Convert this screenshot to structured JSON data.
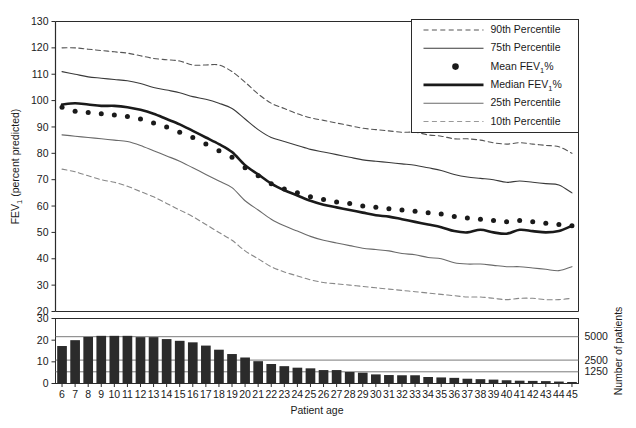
{
  "chart_data": {
    "type": "line",
    "title": "",
    "xlabel": "Patient age",
    "ylabel": "FEV1 (percent predicted)",
    "ylabel_main": "FEV",
    "ylabel_sub": "1",
    "ylabel_rest": " (percent predicted)",
    "y2label": "Number of patients",
    "xlim": [
      6,
      45
    ],
    "ylim": [
      20,
      130
    ],
    "ylim_bars": [
      0,
      30
    ],
    "grid": false,
    "legend_position": "top-right",
    "x": [
      6,
      7,
      8,
      9,
      10,
      11,
      12,
      13,
      14,
      15,
      16,
      17,
      18,
      19,
      20,
      21,
      22,
      23,
      24,
      25,
      26,
      27,
      28,
      29,
      30,
      31,
      32,
      33,
      34,
      35,
      36,
      37,
      38,
      39,
      40,
      41,
      42,
      43,
      44,
      45
    ],
    "x_tick_labels": [
      "6",
      "7",
      "8",
      "9",
      "10",
      "11",
      "12",
      "13",
      "14",
      "15",
      "16",
      "17",
      "18",
      "19",
      "20",
      "21",
      "22",
      "23",
      "24",
      "25",
      "26",
      "27",
      "28",
      "29",
      "30",
      "31",
      "32",
      "33",
      "34",
      "35",
      "36",
      "37",
      "38",
      "39",
      "40",
      "41",
      "42",
      "43",
      "44",
      "45"
    ],
    "y_tick_labels": [
      "20",
      "30",
      "40",
      "50",
      "60",
      "70",
      "80",
      "90",
      "100",
      "110",
      "120",
      "130"
    ],
    "y_ticks": [
      20,
      30,
      40,
      50,
      60,
      70,
      80,
      90,
      100,
      110,
      120,
      130
    ],
    "y_bar_tick_labels": [
      "0",
      "10",
      "20",
      "30"
    ],
    "y_bar_ticks": [
      0,
      10,
      20,
      30
    ],
    "y2_tick_labels": [
      "1250",
      "2500",
      "5000"
    ],
    "y2_ticks": [
      1250,
      2500,
      5000
    ],
    "y2_max": 6818,
    "series": [
      {
        "name": "90th Percentile",
        "style": "dashed",
        "color": "#555555",
        "width": 1.1,
        "values": [
          120,
          120,
          119.5,
          119,
          118.5,
          118,
          117,
          116,
          115.5,
          115,
          113.5,
          113.5,
          113.5,
          111,
          107,
          102.5,
          99,
          97,
          95,
          93.5,
          92.5,
          91.5,
          90.5,
          89.5,
          89,
          88.5,
          88,
          88,
          87,
          86.5,
          85.5,
          85.5,
          85,
          84,
          83.5,
          84,
          83.5,
          83,
          82.5,
          80
        ]
      },
      {
        "name": "75th Percentile",
        "style": "solid-thin",
        "color": "#3a3a3a",
        "width": 1.1,
        "values": [
          111,
          110,
          109,
          108.5,
          108,
          107.5,
          106.5,
          105,
          104,
          103,
          101.5,
          100.5,
          99,
          97,
          93,
          89,
          86,
          84.5,
          83,
          81.5,
          80.5,
          79.5,
          78.5,
          77.5,
          77,
          76.5,
          76,
          75.5,
          74.5,
          73.5,
          72,
          71,
          70.5,
          70,
          69,
          69.5,
          69,
          68.5,
          68,
          65
        ]
      },
      {
        "name": "Mean FEV1%",
        "style": "dots",
        "color": "#1a1a1a",
        "width": 0,
        "values": [
          97.5,
          96,
          95.5,
          95,
          94.5,
          94,
          93,
          91.5,
          90,
          88,
          86,
          83.5,
          81,
          78.5,
          74.5,
          71.5,
          68.5,
          66.5,
          65,
          63.5,
          62.5,
          61.5,
          61,
          60,
          59.5,
          59,
          58.5,
          58,
          57.5,
          57,
          56,
          55.5,
          55,
          54.5,
          54,
          54.5,
          54,
          53.5,
          53,
          52.5
        ]
      },
      {
        "name": "Median FEV1%",
        "style": "solid-thick",
        "color": "#1a1a1a",
        "width": 2.6,
        "values": [
          98.5,
          99,
          98.5,
          98,
          98,
          97.5,
          96.5,
          95,
          93,
          91,
          88.5,
          86,
          83.5,
          80.5,
          75.5,
          72,
          68.5,
          66,
          64,
          62,
          60.5,
          59.5,
          58.5,
          57.5,
          56.5,
          56,
          55,
          54,
          53,
          52,
          50.5,
          50,
          51,
          50,
          49.5,
          51,
          50.5,
          50,
          50.5,
          52.5
        ]
      },
      {
        "name": "25th Percentile",
        "style": "solid-thin",
        "color": "#6a6a6a",
        "width": 1.1,
        "values": [
          87,
          86.5,
          86,
          85.5,
          85,
          84.5,
          83,
          81,
          79,
          77,
          74.5,
          72,
          69.5,
          67,
          62,
          58.5,
          55,
          52.5,
          50.5,
          48.5,
          47,
          46,
          45,
          44,
          43.5,
          43,
          42,
          41.5,
          40.5,
          40,
          38.5,
          38,
          38,
          37.5,
          37,
          37,
          36.5,
          36,
          35.5,
          37
        ]
      },
      {
        "name": "10th Percentile",
        "style": "dashed",
        "color": "#888888",
        "width": 1.1,
        "values": [
          74,
          73,
          71.5,
          70,
          69,
          67.5,
          65.5,
          63.5,
          61,
          58.5,
          56,
          53,
          50,
          47,
          43,
          40,
          37,
          35,
          33.5,
          32,
          31,
          30.5,
          30,
          29.5,
          29,
          28.5,
          28,
          27.5,
          27,
          26.5,
          26,
          25.5,
          25.5,
          25,
          24.5,
          25,
          25,
          24.5,
          24.5,
          25
        ]
      }
    ],
    "bars": {
      "name": "Number of patients",
      "color": "#2b2b2b",
      "values_scaled": [
        17.3,
        20,
        21.5,
        22,
        22,
        22,
        21.4,
        21.4,
        20.5,
        19.7,
        19,
        17.5,
        15.6,
        13.6,
        12,
        10.3,
        9,
        8,
        7.3,
        7,
        6.2,
        6.2,
        5.3,
        5,
        4.2,
        3.9,
        3.8,
        3.8,
        3,
        2.8,
        2.6,
        2.2,
        2,
        1.8,
        1.5,
        1.3,
        1.2,
        1.1,
        0.9,
        0.7
      ]
    }
  },
  "legend": {
    "items": [
      {
        "label": "90th Percentile",
        "marker": "dashed-line"
      },
      {
        "label": "75th Percentile",
        "marker": "solid-thin-line"
      },
      {
        "label": "Mean FEV",
        "sub": "1",
        "suffix": "%",
        "marker": "dot"
      },
      {
        "label": "Median FEV",
        "sub": "1",
        "suffix": "%",
        "marker": "solid-thick-line"
      },
      {
        "label": "25th Percentile",
        "marker": "solid-thin-line"
      },
      {
        "label": "10th Percentile",
        "marker": "dashed-line"
      }
    ]
  }
}
